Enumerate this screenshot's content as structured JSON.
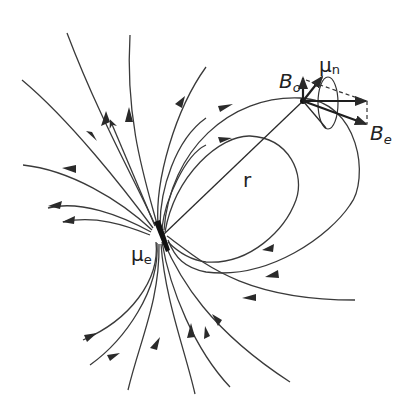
{
  "diagram": {
    "labels": {
      "mu_e": {
        "main": "μ",
        "sub": "e"
      },
      "mu_n": {
        "main": "μ",
        "sub": "n"
      },
      "B_0": {
        "main": "B",
        "sub": "o"
      },
      "B_e": {
        "main": "B",
        "sub": "e"
      },
      "r": {
        "main": "r"
      }
    },
    "elements": [
      "electron magnetic dipole μe at lower-left center",
      "dipole field lines with direction arrows",
      "distance vector r from μe to nucleus",
      "nuclear magnetic moment μn precessing about B0",
      "external field B0 (vertical arrow)",
      "dipole field Be at nucleus, with horizontal component and dashed construction"
    ],
    "colors": {
      "line": "#2a2a2a",
      "background": "#ffffff"
    }
  }
}
